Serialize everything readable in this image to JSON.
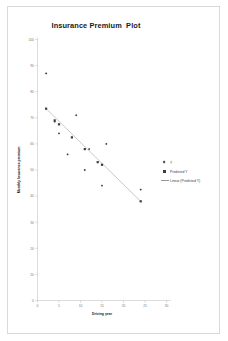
{
  "chart_data": {
    "type": "scatter",
    "title": "Insurance Premium  Plot",
    "xlabel": "Driving year",
    "ylabel": "Monthly Insurance premium",
    "xlim": [
      0,
      30
    ],
    "ylim": [
      0,
      100
    ],
    "xticks": [
      0,
      5,
      10,
      15,
      20,
      25,
      30
    ],
    "yticks": [
      0,
      10,
      20,
      30,
      40,
      50,
      60,
      70,
      80,
      90,
      100
    ],
    "grid": false,
    "legend_position": "right",
    "series": [
      {
        "name": "Y",
        "marker": "diamond",
        "color": "#3c3c3c",
        "points": [
          [
            2,
            87
          ],
          [
            4,
            68.5
          ],
          [
            5,
            64
          ],
          [
            7,
            56
          ],
          [
            9,
            71
          ],
          [
            11,
            50
          ],
          [
            12,
            58
          ],
          [
            15,
            44
          ],
          [
            16,
            60
          ],
          [
            24,
            42.5
          ]
        ]
      },
      {
        "name": "Predicted Y",
        "marker": "square",
        "color": "#3c3c3c",
        "points": [
          [
            2,
            73.5
          ],
          [
            4,
            69
          ],
          [
            5,
            67.5
          ],
          [
            8,
            62.5
          ],
          [
            11,
            58
          ],
          [
            14,
            53
          ],
          [
            15,
            52
          ],
          [
            24,
            38
          ]
        ]
      },
      {
        "name": "Linear (Predicted Y)",
        "marker": "line",
        "color": "#9a9a9a",
        "points": [
          [
            2,
            73.5
          ],
          [
            24,
            38
          ]
        ]
      }
    ]
  },
  "legend": {
    "items": [
      {
        "label": "Y",
        "marker": "diamond"
      },
      {
        "label": "Predicted Y",
        "marker": "square"
      },
      {
        "label": "Linear (Predicted Y)",
        "marker": "line"
      }
    ]
  }
}
